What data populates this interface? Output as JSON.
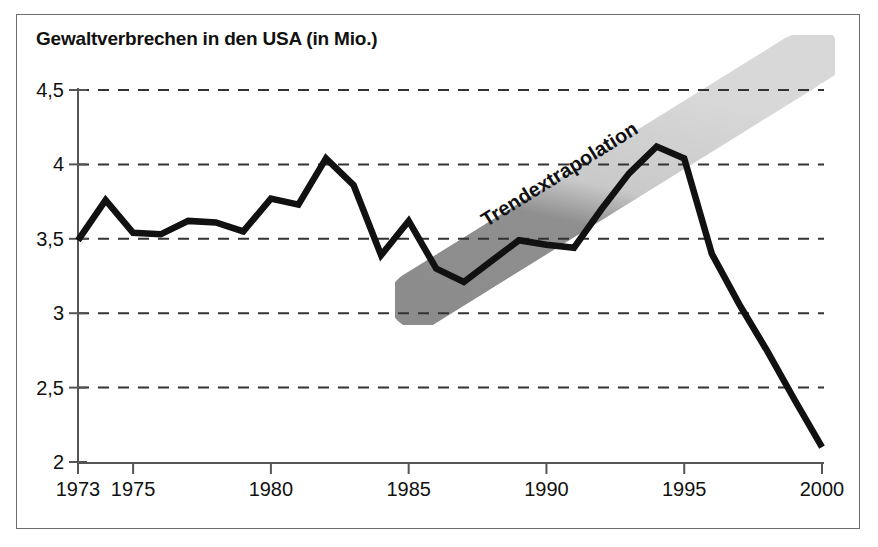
{
  "chart_data": {
    "type": "line",
    "title": "Gewaltverbrechen in den USA (in Mio.)",
    "xlabel": "",
    "ylabel": "",
    "xlim": [
      1973,
      2000
    ],
    "ylim": [
      2,
      4.5
    ],
    "grid": true,
    "legend": null,
    "ytick_labels": [
      "2",
      "2,5",
      "3",
      "3,5",
      "4",
      "4,5"
    ],
    "ytick_values": [
      2,
      2.5,
      3,
      3.5,
      4,
      4.5
    ],
    "xtick_labels": [
      "1973",
      "1975",
      "1980",
      "1985",
      "1990",
      "1995",
      "2000"
    ],
    "xtick_values": [
      1973,
      1975,
      1980,
      1985,
      1990,
      1995,
      2000
    ],
    "x": [
      1973,
      1974,
      1975,
      1976,
      1977,
      1978,
      1979,
      1980,
      1981,
      1982,
      1983,
      1984,
      1985,
      1986,
      1987,
      1988,
      1989,
      1990,
      1991,
      1992,
      1993,
      1994,
      1995,
      1996,
      1997,
      1998,
      1999,
      2000
    ],
    "values": [
      3.49,
      3.76,
      3.54,
      3.53,
      3.62,
      3.61,
      3.55,
      3.77,
      3.73,
      4.04,
      3.86,
      3.39,
      3.62,
      3.3,
      3.21,
      3.35,
      3.49,
      3.46,
      3.44,
      3.7,
      3.94,
      4.12,
      4.04,
      3.4,
      3.06,
      2.75,
      2.42,
      2.1
    ],
    "annotations": [
      {
        "text": "Trendextrapolation",
        "kind": "trend-band",
        "band_start": {
          "x": 1985.0,
          "y": 3.2
        },
        "band_end": {
          "x": 2000.0,
          "y": 4.45
        }
      }
    ],
    "colors": {
      "line": "#111111",
      "grid": "#333333",
      "band_light": "#d6d6d6",
      "band_dark": "#8c8c8c",
      "frame": "#6d6d6d",
      "text": "#111111"
    }
  },
  "labels": {
    "annotation_text": "Trendextrapolation"
  }
}
